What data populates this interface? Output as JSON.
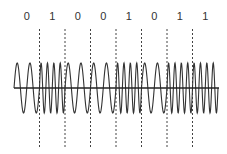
{
  "diagram": {
    "type": "fsk-modulation",
    "bits": [
      "0",
      "1",
      "0",
      "0",
      "1",
      "0",
      "1",
      "1"
    ],
    "cycles_per_bit": {
      "0": 2,
      "1": 4
    },
    "layout": {
      "x_start": 14,
      "cell_width": 25.5,
      "axis_y": 88,
      "amplitude": 25,
      "label_y": 20,
      "divider_top": 29,
      "divider_bottom": 148
    },
    "colors": {
      "wave": "#333333",
      "axis": "#222222",
      "divider": "#444444",
      "label": "#333333"
    }
  }
}
